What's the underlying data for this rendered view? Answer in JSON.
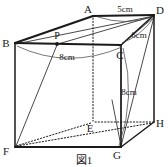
{
  "figure": {
    "caption": "図1",
    "background_color": "#ffffff",
    "line_color": "#1a1a1a",
    "arc_color": "#4a4a4a",
    "shape": "rectangular prism (cuboid) in oblique projection"
  },
  "vertices": [
    {
      "id": "A",
      "label": "A",
      "x": 93,
      "y": 16,
      "label_x": 88,
      "label_y": 13,
      "hidden": false,
      "role": "top-back-left"
    },
    {
      "id": "B",
      "label": "B",
      "x": 15,
      "y": 43,
      "label_x": 3,
      "label_y": 46,
      "hidden": false,
      "role": "top-front-left"
    },
    {
      "id": "C",
      "label": "C",
      "x": 121,
      "y": 45,
      "label_x": 117,
      "label_y": 57,
      "hidden": false,
      "role": "top-front-right"
    },
    {
      "id": "D",
      "label": "D",
      "x": 154,
      "y": 15,
      "label_x": 157,
      "label_y": 13,
      "hidden": false,
      "role": "top-back-right"
    },
    {
      "id": "E",
      "label": "E",
      "x": 93,
      "y": 122,
      "label_x": 87,
      "label_y": 131,
      "hidden": true,
      "role": "bottom-back-left"
    },
    {
      "id": "F",
      "label": "F",
      "x": 15,
      "y": 147,
      "label_x": 3,
      "label_y": 154,
      "hidden": false,
      "role": "bottom-front-left"
    },
    {
      "id": "G",
      "label": "G",
      "x": 121,
      "y": 147,
      "label_x": 114,
      "label_y": 158,
      "hidden": false,
      "role": "bottom-front-right"
    },
    {
      "id": "H",
      "label": "H",
      "x": 154,
      "y": 122,
      "label_x": 157,
      "label_y": 126,
      "hidden": false,
      "role": "bottom-back-right"
    },
    {
      "id": "P",
      "label": "P",
      "x": 57,
      "y": 44,
      "label_x": 53,
      "label_y": 38,
      "hidden": false,
      "role": "point-on-edge-BC"
    }
  ],
  "dimensions": [
    {
      "id": "AD",
      "label": "5cm",
      "value": 5,
      "unit": "cm",
      "label_x": 106,
      "label_y": 11,
      "measures": "A to D (top back edge)"
    },
    {
      "id": "DC",
      "label": "6cm",
      "value": 6,
      "unit": "cm",
      "label_x": 133,
      "label_y": 38,
      "measures": "D to C (top right edge)"
    },
    {
      "id": "BC",
      "label": "8cm",
      "value": 8,
      "unit": "cm",
      "label_x": 56,
      "label_y": 59,
      "measures": "B to C (top front edge)"
    },
    {
      "id": "CG",
      "label": "8cm",
      "value": 8,
      "unit": "cm",
      "label_x": 121,
      "label_y": 94,
      "measures": "C to G (vertical edge)"
    }
  ],
  "caption": {
    "text": "図1",
    "x": 84,
    "y": 162
  }
}
